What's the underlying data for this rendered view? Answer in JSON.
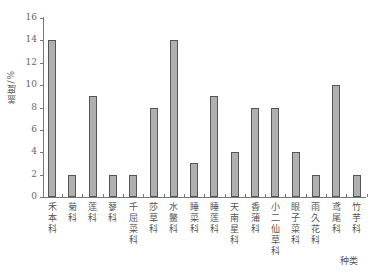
{
  "chart_data": {
    "type": "bar",
    "title": "",
    "xlabel": "种类",
    "ylabel": "盖度/%",
    "ylim": [
      0,
      16
    ],
    "yticks": [
      0,
      2,
      4,
      6,
      8,
      10,
      12,
      14,
      16
    ],
    "grid": false,
    "legend": null,
    "categories": [
      "禾本科",
      "菊科",
      "莲科",
      "蓼科",
      "千屈菜科",
      "莎草科",
      "水鳖科",
      "睡菜科",
      "睡莲科",
      "天南星科",
      "香蒲科",
      "小二仙草科",
      "眼子菜科",
      "雨久花科",
      "鸢尾科",
      "竹芋科"
    ],
    "values": [
      14,
      2,
      9,
      2,
      2,
      8,
      14,
      3,
      9,
      4,
      8,
      8,
      4,
      2,
      10,
      2
    ],
    "bar_color": "#b0b0b0",
    "bar_edge_color": "#555555"
  }
}
